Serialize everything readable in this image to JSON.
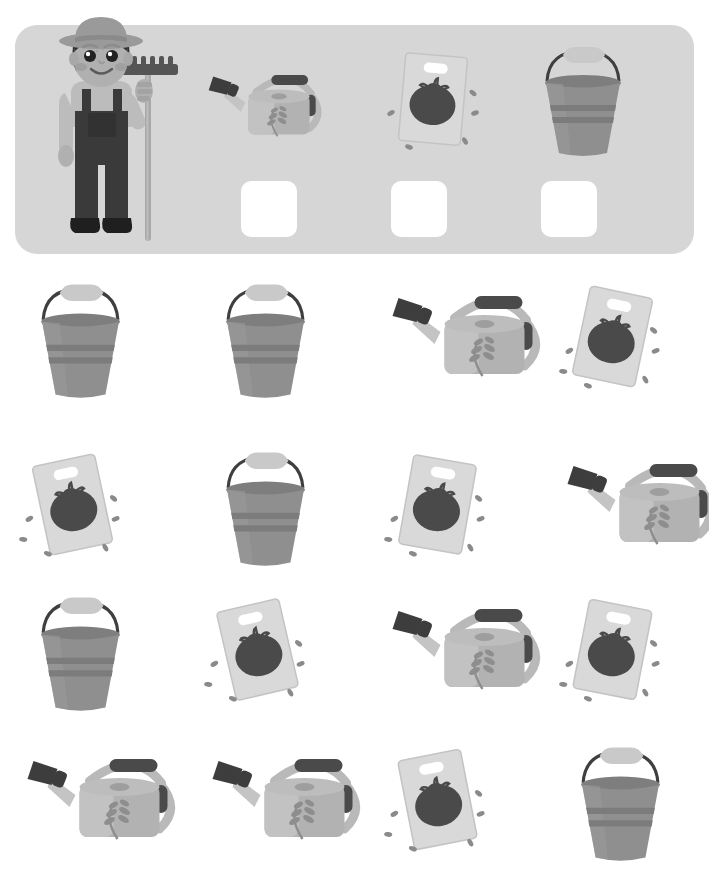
{
  "page": {
    "background_color": "#ffffff",
    "width": 709,
    "height": 877
  },
  "palette": {
    "banner_bg": "#d6d6d6",
    "answer_box": "#ffffff",
    "bucket_body": "#8f8f8f",
    "bucket_body_light": "#9b9b9b",
    "bucket_rim": "#7e7e7e",
    "bucket_band": "#7c7c7c",
    "bucket_handle": "#3f3f3f",
    "bucket_grip": "#c9c9c9",
    "can_body": "#b2b2b2",
    "can_body_light": "#c2c2c2",
    "can_spout": "#c4c4c4",
    "can_nozzle": "#3d3d3d",
    "can_grip": "#4a4a4a",
    "can_leaf": "#8e8e8e",
    "packet_card": "#d9d9d9",
    "packet_card_edge": "#c4c4c4",
    "tomato": "#4a4a4a",
    "seed": "#8a8a8a",
    "skin": "#b0b0b0",
    "hat": "#9a9a9a",
    "hair": "#2f2f2f",
    "overalls": "#3a3a3a",
    "shirt": "#bcbcbc",
    "rake_head": "#555555",
    "rake_handle": "#a8a8a8",
    "boots": "#1f1f1f"
  },
  "banner": {
    "name": "prompt-banner",
    "character": {
      "name": "farmer-character",
      "label": "farmer holding a rake"
    },
    "prompts": [
      {
        "icon": "watering-can-icon",
        "label": "watering can",
        "answer_value": ""
      },
      {
        "icon": "seed-packet-icon",
        "label": "tomato seed packet",
        "answer_value": ""
      },
      {
        "icon": "bucket-icon",
        "label": "bucket",
        "answer_value": ""
      }
    ]
  },
  "grid": {
    "name": "counting-grid",
    "columns": 4,
    "rows": 4,
    "cells": [
      {
        "icon": "bucket-icon",
        "label": "bucket",
        "rotate": 0
      },
      {
        "icon": "bucket-icon",
        "label": "bucket",
        "rotate": 0
      },
      {
        "icon": "watering-can-icon",
        "label": "watering can",
        "rotate": 0
      },
      {
        "icon": "seed-packet-icon",
        "label": "tomato seed packet",
        "rotate": 12
      },
      {
        "icon": "seed-packet-icon",
        "label": "tomato seed packet",
        "rotate": -12
      },
      {
        "icon": "bucket-icon",
        "label": "bucket",
        "rotate": 0
      },
      {
        "icon": "seed-packet-icon",
        "label": "tomato seed packet",
        "rotate": 10
      },
      {
        "icon": "watering-can-icon",
        "label": "watering can",
        "rotate": 0
      },
      {
        "icon": "bucket-icon",
        "label": "bucket",
        "rotate": 0
      },
      {
        "icon": "seed-packet-icon",
        "label": "tomato seed packet",
        "rotate": -13
      },
      {
        "icon": "watering-can-icon",
        "label": "watering can",
        "rotate": 0
      },
      {
        "icon": "seed-packet-icon",
        "label": "tomato seed packet",
        "rotate": 11
      },
      {
        "icon": "watering-can-icon",
        "label": "watering can",
        "rotate": 0
      },
      {
        "icon": "watering-can-icon",
        "label": "watering can",
        "rotate": 0
      },
      {
        "icon": "seed-packet-icon",
        "label": "tomato seed packet",
        "rotate": -11
      },
      {
        "icon": "bucket-icon",
        "label": "bucket",
        "rotate": 0
      }
    ],
    "totals": {
      "bucket": 5,
      "watering_can": 5,
      "seed_packet": 6
    }
  }
}
